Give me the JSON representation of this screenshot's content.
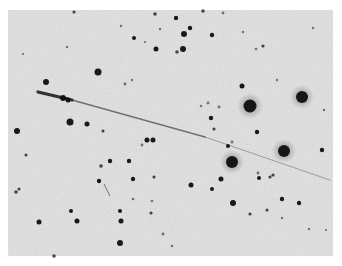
{
  "image": {
    "description": "Negative astronomical photograph: dark stars on a light gray grainy sky with a diagonal trail",
    "background_color": "#ffffff",
    "sky_color": "#e6e6e6",
    "star_color": "#111111",
    "field_bounds": {
      "x": 8,
      "y": 10,
      "width": 325,
      "height": 246
    }
  },
  "trail": {
    "color": "#2a2a2a",
    "head": {
      "x1": 38,
      "y1": 92,
      "x2": 72,
      "y2": 100,
      "width": 3.2
    },
    "tail": {
      "x1": 72,
      "y1": 100,
      "x2": 205,
      "y2": 137,
      "width": 1.6
    },
    "faint_tail": {
      "x1": 205,
      "y1": 137,
      "x2": 330,
      "y2": 180,
      "width": 1.0
    }
  },
  "stars": [
    {
      "x": 250,
      "y": 106,
      "r": 6.5
    },
    {
      "x": 302,
      "y": 97,
      "r": 6
    },
    {
      "x": 232,
      "y": 162,
      "r": 6
    },
    {
      "x": 284,
      "y": 151,
      "r": 6
    },
    {
      "x": 98,
      "y": 72,
      "r": 3.5
    },
    {
      "x": 70,
      "y": 122,
      "r": 3.5
    },
    {
      "x": 46,
      "y": 82,
      "r": 3
    },
    {
      "x": 17,
      "y": 131,
      "r": 3
    },
    {
      "x": 87,
      "y": 124,
      "r": 2.5
    },
    {
      "x": 63,
      "y": 98,
      "r": 3
    },
    {
      "x": 68,
      "y": 100,
      "r": 2.5
    },
    {
      "x": 184,
      "y": 34,
      "r": 3
    },
    {
      "x": 190,
      "y": 28,
      "r": 2.2
    },
    {
      "x": 212,
      "y": 35,
      "r": 2.2
    },
    {
      "x": 183,
      "y": 49,
      "r": 3
    },
    {
      "x": 177,
      "y": 52,
      "r": 1.8
    },
    {
      "x": 156,
      "y": 49,
      "r": 2.5
    },
    {
      "x": 134,
      "y": 38,
      "r": 2
    },
    {
      "x": 155,
      "y": 14,
      "r": 1.8
    },
    {
      "x": 176,
      "y": 18,
      "r": 2.2
    },
    {
      "x": 203,
      "y": 11,
      "r": 1.8
    },
    {
      "x": 242,
      "y": 86,
      "r": 2.5
    },
    {
      "x": 263,
      "y": 46,
      "r": 1.6
    },
    {
      "x": 256,
      "y": 49,
      "r": 1.3
    },
    {
      "x": 277,
      "y": 80,
      "r": 1.2
    },
    {
      "x": 211,
      "y": 118,
      "r": 2.2
    },
    {
      "x": 214,
      "y": 129,
      "r": 1.6
    },
    {
      "x": 228,
      "y": 146,
      "r": 2
    },
    {
      "x": 257,
      "y": 132,
      "r": 2.2
    },
    {
      "x": 322,
      "y": 150,
      "r": 2.2
    },
    {
      "x": 273,
      "y": 175,
      "r": 1.6
    },
    {
      "x": 232,
      "y": 142,
      "r": 1.4
    },
    {
      "x": 219,
      "y": 107,
      "r": 1.4
    },
    {
      "x": 208,
      "y": 103,
      "r": 1.4
    },
    {
      "x": 201,
      "y": 106,
      "r": 1.2
    },
    {
      "x": 191,
      "y": 185,
      "r": 2.5
    },
    {
      "x": 212,
      "y": 189,
      "r": 2
    },
    {
      "x": 221,
      "y": 179,
      "r": 2.5
    },
    {
      "x": 233,
      "y": 203,
      "r": 3
    },
    {
      "x": 250,
      "y": 214,
      "r": 1.6
    },
    {
      "x": 259,
      "y": 178,
      "r": 2
    },
    {
      "x": 270,
      "y": 177,
      "r": 1.6
    },
    {
      "x": 282,
      "y": 199,
      "r": 2.2
    },
    {
      "x": 299,
      "y": 203,
      "r": 2.2
    },
    {
      "x": 267,
      "y": 210,
      "r": 1.5
    },
    {
      "x": 258,
      "y": 173,
      "r": 1.4
    },
    {
      "x": 129,
      "y": 161,
      "r": 2.2
    },
    {
      "x": 133,
      "y": 179,
      "r": 2.2
    },
    {
      "x": 147,
      "y": 140,
      "r": 2.5
    },
    {
      "x": 153,
      "y": 140,
      "r": 2.5
    },
    {
      "x": 154,
      "y": 177,
      "r": 1.6
    },
    {
      "x": 142,
      "y": 145,
      "r": 1.4
    },
    {
      "x": 110,
      "y": 161,
      "r": 2.2
    },
    {
      "x": 101,
      "y": 166,
      "r": 1.8
    },
    {
      "x": 99,
      "y": 181,
      "r": 2.2
    },
    {
      "x": 103,
      "y": 131,
      "r": 1.5
    },
    {
      "x": 120,
      "y": 211,
      "r": 2
    },
    {
      "x": 39,
      "y": 222,
      "r": 2.5
    },
    {
      "x": 71,
      "y": 211,
      "r": 2
    },
    {
      "x": 77,
      "y": 221,
      "r": 2.5
    },
    {
      "x": 120,
      "y": 243,
      "r": 3
    },
    {
      "x": 121,
      "y": 221,
      "r": 2.5
    },
    {
      "x": 151,
      "y": 213,
      "r": 1.6
    },
    {
      "x": 16,
      "y": 192,
      "r": 1.8
    },
    {
      "x": 19,
      "y": 189,
      "r": 1.5
    },
    {
      "x": 26,
      "y": 155,
      "r": 1.5
    },
    {
      "x": 163,
      "y": 234,
      "r": 1.4
    },
    {
      "x": 172,
      "y": 246,
      "r": 1.2
    },
    {
      "x": 133,
      "y": 199,
      "r": 1.3
    },
    {
      "x": 152,
      "y": 201,
      "r": 1.3
    },
    {
      "x": 223,
      "y": 13,
      "r": 1.4
    },
    {
      "x": 243,
      "y": 32,
      "r": 1.2
    },
    {
      "x": 313,
      "y": 28,
      "r": 1.2
    },
    {
      "x": 121,
      "y": 26,
      "r": 1.2
    },
    {
      "x": 67,
      "y": 47,
      "r": 1.2
    },
    {
      "x": 74,
      "y": 12,
      "r": 1.6
    },
    {
      "x": 23,
      "y": 54,
      "r": 1
    },
    {
      "x": 160,
      "y": 29,
      "r": 1.2
    },
    {
      "x": 145,
      "y": 42,
      "r": 1
    },
    {
      "x": 125,
      "y": 84,
      "r": 1.4
    },
    {
      "x": 132,
      "y": 80,
      "r": 1.2
    },
    {
      "x": 324,
      "y": 110,
      "r": 1.2
    },
    {
      "x": 309,
      "y": 229,
      "r": 1.2
    },
    {
      "x": 326,
      "y": 230,
      "r": 1
    },
    {
      "x": 282,
      "y": 218,
      "r": 1.2
    },
    {
      "x": 54,
      "y": 256,
      "r": 1.8
    }
  ],
  "streak_mark": {
    "x1": 104,
    "y1": 184,
    "x2": 110,
    "y2": 196,
    "color": "#555555"
  }
}
